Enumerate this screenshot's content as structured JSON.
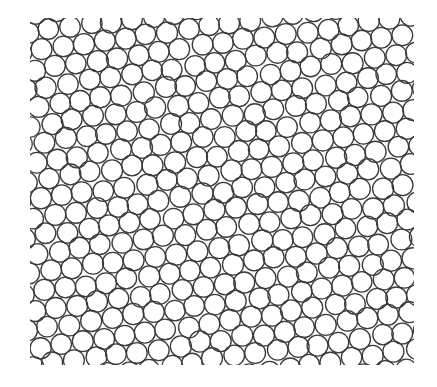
{
  "figure": {
    "type": "circle-packing",
    "background": "#ffffff",
    "stroke_color": "#3a3a3a",
    "stroke_width": 1.3,
    "region": {
      "x": 30,
      "y": 18,
      "width": 384,
      "height": 347
    },
    "circle_radius": 10.4,
    "lattice_spacing": 21.2,
    "row_angle_deg": -8,
    "jitter": 1.6,
    "seed": 7
  }
}
